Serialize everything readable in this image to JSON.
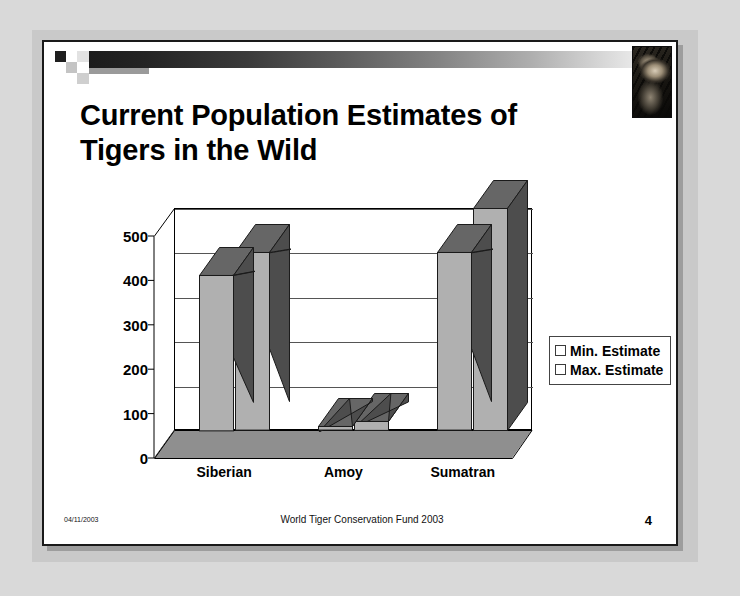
{
  "slide": {
    "title": "Current Population Estimates of Tigers in the Wild",
    "title_line1": "Current Population Estimates of",
    "title_line2": "Tigers in the Wild",
    "decor": {
      "tiger_photo_alt": "tiger-photo",
      "gradient_from": "#1c1c1c",
      "gradient_to": "#f4f4f4"
    },
    "footer": {
      "date": "04/11/2003",
      "center": "World Tiger Conservation Fund 2003",
      "page_number": "4"
    }
  },
  "chart_data": {
    "type": "bar",
    "title": "",
    "xlabel": "",
    "ylabel": "",
    "categories": [
      "Siberian",
      "Amoy",
      "Sumatran"
    ],
    "series": [
      {
        "name": "Min. Estimate",
        "values": [
          350,
          8,
          400
        ],
        "color": "#b0b0b0"
      },
      {
        "name": "Max. Estimate",
        "values": [
          400,
          20,
          500
        ],
        "color": "#b0b0b0"
      }
    ],
    "ylim": [
      0,
      500
    ],
    "yticks": [
      0,
      100,
      200,
      300,
      400,
      500
    ],
    "ytick_labels": [
      "0",
      "100",
      "200",
      "300",
      "400",
      "500"
    ],
    "grid": true,
    "legend_position": "right",
    "three_d": true
  }
}
